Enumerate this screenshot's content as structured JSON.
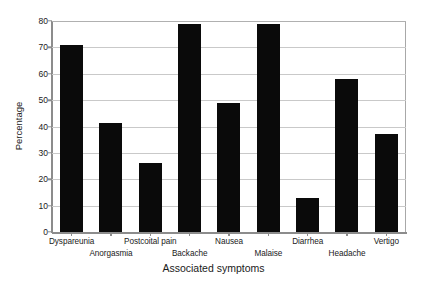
{
  "chart_data": {
    "type": "bar",
    "title": "",
    "xlabel": "Associated symptoms",
    "ylabel": "Percentage",
    "categories": [
      "Dyspareunia",
      "Anorgasmia",
      "Postcoital pain",
      "Backache",
      "Nausea",
      "Malaise",
      "Diarrhea",
      "Headache",
      "Vertigo"
    ],
    "values": [
      71,
      41.5,
      26,
      79,
      49,
      79,
      13,
      58,
      37
    ],
    "ylim": [
      0,
      80
    ],
    "yticks": [
      0,
      10,
      20,
      30,
      40,
      50,
      60,
      70,
      80
    ],
    "ytick_labels": [
      "0",
      "10",
      "20",
      "30",
      "40",
      "50",
      "60",
      "70",
      "80"
    ],
    "grid": "horizontal",
    "legend": "none",
    "bar_color": "#0a0a0a",
    "grid_color": "#c9c9c9",
    "axis_color": "#8c8c8c",
    "background": "#ffffff",
    "label_rows": [
      0,
      1,
      0,
      1,
      0,
      1,
      0,
      1,
      0
    ]
  }
}
